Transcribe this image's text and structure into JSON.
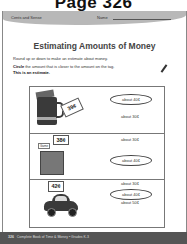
{
  "page_label": "Page 326",
  "header": {
    "series": "Cents and Sense",
    "name_label": "Name"
  },
  "title": "Estimating Amounts of Money",
  "instructions": {
    "line1": "Round up or down to make an estimate about money.",
    "line2_bold": "Circle",
    "line2_rest": " the amount that is closer to the amount on the tag.",
    "line3": "This is an estimate."
  },
  "rows": [
    {
      "item": "mug",
      "price": "39¢",
      "options": [
        {
          "label": "about 40¢",
          "circled": true
        },
        {
          "label": "about 30¢",
          "circled": false
        }
      ]
    },
    {
      "item": "game",
      "item_label": "Game",
      "price": "38¢",
      "options": [
        {
          "label": "about 30¢",
          "circled": false
        },
        {
          "label": "about 40¢",
          "circled": true
        }
      ]
    },
    {
      "item": "car",
      "price": "42¢",
      "options": [
        {
          "label": "about 30¢",
          "circled": false
        },
        {
          "label": "about 40¢",
          "circled": true
        },
        {
          "label": "about 50¢",
          "circled": false
        }
      ]
    }
  ],
  "footer": {
    "page_number": "326",
    "book_title": "Complete Book of Time & Money • Grades K-3"
  }
}
